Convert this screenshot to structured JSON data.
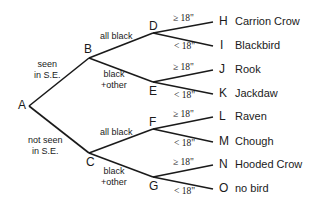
{
  "diagram": {
    "type": "decision-tree",
    "nodes": {
      "A": "A",
      "B": "B",
      "C": "C",
      "D": "D",
      "E": "E",
      "F": "F",
      "G": "G",
      "H": "H",
      "I": "I",
      "J": "J",
      "K": "K",
      "L": "L",
      "M": "M",
      "N": "N",
      "O": "O"
    },
    "edges": {
      "AB_line1": "seen",
      "AB_line2": "in S.E.",
      "AC_line1": "not seen",
      "AC_line2": "in S.E.",
      "BD": "all black",
      "BE_line1": "black",
      "BE_line2": "+other",
      "CF": "all black",
      "CG_line1": "black",
      "CG_line2": "+other",
      "ge18": "≥ 18\"",
      "lt18": "< 18\""
    },
    "leaves": {
      "H": "Carrion Crow",
      "I": "Blackbird",
      "J": "Rook",
      "K": "Jackdaw",
      "L": "Raven",
      "M": "Chough",
      "N": "Hooded Crow",
      "O": "no bird"
    }
  }
}
